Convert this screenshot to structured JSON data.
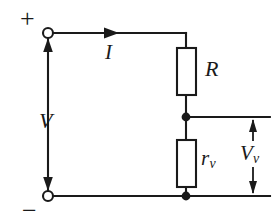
{
  "figure": {
    "name": "voltmeter-loading-circuit",
    "background_color": "#ffffff",
    "stroke_color": "#1a1a1a",
    "width": 278,
    "height": 224
  },
  "terminals": {
    "positive_sign": "+",
    "negative_sign": "−"
  },
  "labels": {
    "source_voltage": "V",
    "current": "I",
    "resistor": "R",
    "voltmeter_resistance_base": "r",
    "voltmeter_resistance_sub": "v",
    "measured_voltage_base": "V",
    "measured_voltage_sub": "v"
  },
  "components": [
    {
      "name": "resistor-R",
      "label": "R",
      "type": "resistor",
      "x": 177,
      "y": 48,
      "w": 19,
      "h": 47
    },
    {
      "name": "resistor-rv",
      "label": "rv",
      "type": "resistor",
      "x": 177,
      "y": 140,
      "w": 19,
      "h": 47
    }
  ],
  "nodes": [
    {
      "name": "terminal-positive",
      "type": "open-circle",
      "cx": 48,
      "cy": 33,
      "r": 5
    },
    {
      "name": "terminal-negative",
      "type": "open-circle",
      "cx": 48,
      "cy": 196,
      "r": 5
    },
    {
      "name": "junction-middle",
      "type": "filled-dot",
      "cx": 186,
      "cy": 117,
      "r": 4
    },
    {
      "name": "junction-bottom",
      "type": "filled-dot",
      "cx": 186,
      "cy": 196,
      "r": 4
    }
  ],
  "arrows": [
    {
      "name": "current-arrow",
      "direction": "right",
      "x": 118,
      "y": 33
    },
    {
      "name": "source-voltage-arrow-up",
      "direction": "up",
      "x": 48,
      "y": 41
    },
    {
      "name": "source-voltage-arrow-down",
      "direction": "down",
      "x": 48,
      "y": 188
    },
    {
      "name": "measured-voltage-arrow-up",
      "direction": "up",
      "x": 253,
      "y": 122
    },
    {
      "name": "measured-voltage-arrow-down",
      "direction": "down",
      "x": 253,
      "y": 191
    }
  ]
}
